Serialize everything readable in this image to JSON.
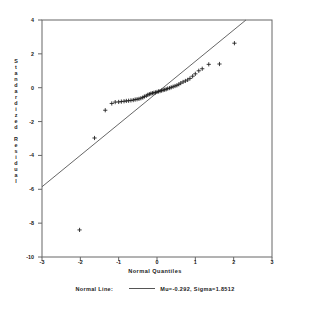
{
  "chart_data": {
    "type": "scatter",
    "title": "",
    "xlabel": "Normal Quantiles",
    "ylabel": "Standardized Residual",
    "xlim": [
      -3,
      3
    ],
    "ylim": [
      -10,
      4
    ],
    "xticks": [
      "-3",
      "-2",
      "-1",
      "0",
      "1",
      "2",
      "3"
    ],
    "xtick_values": [
      -3,
      -2,
      -1,
      0,
      1,
      2,
      3
    ],
    "yticks": [
      "4",
      "2",
      "0",
      "-2",
      "-4",
      "-6",
      "-8",
      "-10"
    ],
    "ytick_values": [
      4,
      2,
      0,
      -2,
      -4,
      -6,
      -8,
      -10
    ],
    "grid": false,
    "marker": "plus",
    "series": [
      {
        "name": "Standardized Residual",
        "x": [
          -2.02,
          -1.63,
          -1.35,
          -1.18,
          -1.09,
          -1.0,
          -0.93,
          -0.86,
          -0.8,
          -0.74,
          -0.68,
          -0.62,
          -0.57,
          -0.52,
          -0.47,
          -0.42,
          -0.37,
          -0.33,
          -0.28,
          -0.24,
          -0.2,
          -0.16,
          -0.12,
          -0.08,
          -0.04,
          0.0,
          0.04,
          0.08,
          0.12,
          0.16,
          0.2,
          0.24,
          0.28,
          0.33,
          0.37,
          0.42,
          0.47,
          0.52,
          0.57,
          0.62,
          0.68,
          0.74,
          0.8,
          0.86,
          0.93,
          1.0,
          1.09,
          1.18,
          1.35,
          1.63,
          2.02
        ],
        "y": [
          -8.4,
          -2.97,
          -1.33,
          -0.93,
          -0.85,
          -0.84,
          -0.82,
          -0.8,
          -0.78,
          -0.77,
          -0.75,
          -0.73,
          -0.7,
          -0.68,
          -0.66,
          -0.62,
          -0.58,
          -0.52,
          -0.48,
          -0.42,
          -0.38,
          -0.35,
          -0.32,
          -0.3,
          -0.28,
          -0.25,
          -0.22,
          -0.2,
          -0.17,
          -0.14,
          -0.12,
          -0.09,
          -0.05,
          -0.02,
          0.02,
          0.06,
          0.1,
          0.14,
          0.2,
          0.27,
          0.34,
          0.4,
          0.46,
          0.55,
          0.68,
          0.82,
          1.0,
          1.12,
          1.38,
          1.4,
          2.63
        ]
      }
    ],
    "reference_line": {
      "name": "Normal Line",
      "mu": -0.292,
      "sigma": 1.8512,
      "x_start": -3.0,
      "y_start": -5.85,
      "x_end": 2.32,
      "y_end": 4.0
    }
  },
  "legend": {
    "label": "Normal Line:",
    "value": "Mu=-0.292, Sigma=1.8512"
  },
  "y_title_chars": [
    "S",
    "t",
    "a",
    "n",
    "d",
    "a",
    "r",
    "d",
    "i",
    "z",
    "e",
    "d",
    "",
    "R",
    "e",
    "s",
    "i",
    "d",
    "u",
    "a",
    "l"
  ]
}
